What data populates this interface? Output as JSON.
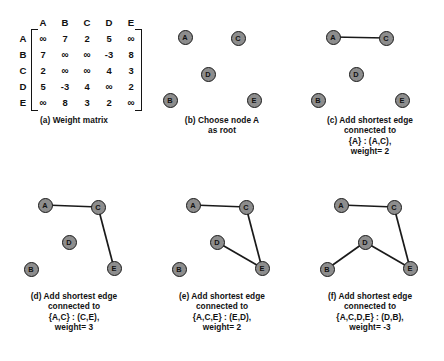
{
  "matrix": {
    "col_headers": [
      "A",
      "B",
      "C",
      "D",
      "E"
    ],
    "row_headers": [
      "A",
      "B",
      "C",
      "D",
      "E"
    ],
    "rows": [
      [
        "∞",
        "7",
        "2",
        "5",
        "∞"
      ],
      [
        "7",
        "∞",
        "∞",
        "-3",
        "8"
      ],
      [
        "2",
        "∞",
        "∞",
        "4",
        "3"
      ],
      [
        "5",
        "-3",
        "4",
        "∞",
        "2"
      ],
      [
        "∞",
        "8",
        "3",
        "2",
        "∞"
      ]
    ]
  },
  "node_labels": {
    "A": "A",
    "B": "B",
    "C": "C",
    "D": "D",
    "E": "E"
  },
  "panels": [
    {
      "id": "a",
      "caption_lines": [
        "(a) Weight matrix"
      ]
    },
    {
      "id": "b",
      "caption_lines": [
        "(b) Choose node A",
        "as root"
      ]
    },
    {
      "id": "c",
      "caption_lines": [
        "(c) Add shortest edge",
        "connected to",
        "{A} : (A,C),",
        "weight= 2"
      ]
    },
    {
      "id": "d",
      "caption_lines": [
        "(d) Add shortest edge",
        "connected to",
        "{A,C} : (C,E),",
        "weight= 3"
      ]
    },
    {
      "id": "e",
      "caption_lines": [
        "(e) Add shortest edge",
        "connected to",
        "{A,C,E} : (E,D),",
        "weight= 2"
      ]
    },
    {
      "id": "f",
      "caption_lines": [
        "(f) Add shortest edge",
        "connected to",
        "{A,C,D,E} : (D,B),",
        "weight= -3"
      ]
    }
  ],
  "colors": {
    "node_fill": "#8d8d8d",
    "node_stroke": "#1a1a1a",
    "edge_stroke": "#1a1a1a",
    "text": "#111111",
    "background": "#ffffff"
  }
}
